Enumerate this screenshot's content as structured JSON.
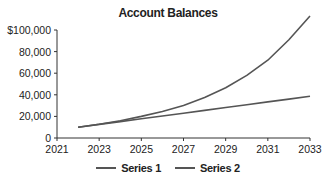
{
  "chart_data": {
    "type": "line",
    "title": "Account Balances",
    "xlabel": "",
    "ylabel": "",
    "x": [
      2022,
      2023,
      2024,
      2025,
      2026,
      2027,
      2028,
      2029,
      2030,
      2031,
      2032,
      2033
    ],
    "series": [
      {
        "name": "Series 1",
        "color": "#555555",
        "values": [
          10000,
          12800,
          16000,
          20000,
          24500,
          30000,
          37500,
          46500,
          58000,
          72000,
          91000,
          113000
        ]
      },
      {
        "name": "Series 2",
        "color": "#555555",
        "values": [
          10000,
          12600,
          15200,
          17800,
          20400,
          23000,
          25600,
          28200,
          30800,
          33400,
          36000,
          38600
        ]
      }
    ],
    "xlim": [
      2021,
      2033
    ],
    "ylim": [
      0,
      100000
    ],
    "x_ticks": [
      "2021",
      "2023",
      "2025",
      "2027",
      "2029",
      "2031",
      "2033"
    ],
    "y_ticks": [
      "0",
      "20,000",
      "40,000",
      "60,000",
      "80,000",
      "$100,000"
    ],
    "grid": false,
    "legend_position": "bottom"
  }
}
